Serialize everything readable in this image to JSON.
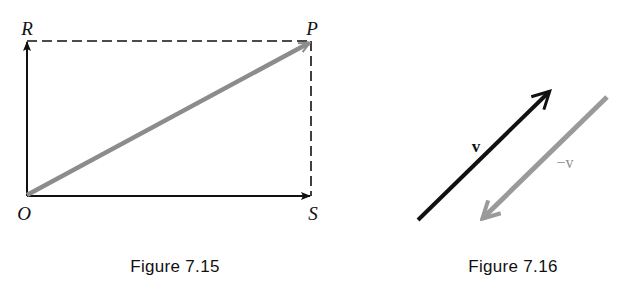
{
  "figures": [
    {
      "caption": "Figure 7.15",
      "points": {
        "O": {
          "label": "O",
          "x": 27,
          "y": 196
        },
        "R": {
          "label": "R",
          "x": 27,
          "y": 41
        },
        "P": {
          "label": "P",
          "x": 311,
          "y": 41
        },
        "S": {
          "label": "S",
          "x": 311,
          "y": 196
        }
      },
      "elements": [
        {
          "type": "arrow",
          "from": "O",
          "to": "R",
          "style": "solid",
          "color": "#111111"
        },
        {
          "type": "arrow",
          "from": "O",
          "to": "S",
          "style": "solid",
          "color": "#111111"
        },
        {
          "type": "arrow",
          "from": "O",
          "to": "P",
          "style": "solid-thick",
          "color": "#8c8c8c"
        },
        {
          "type": "line",
          "from": "R",
          "to": "P",
          "style": "dashed",
          "color": "#111111"
        },
        {
          "type": "line",
          "from": "S",
          "to": "P",
          "style": "dashed",
          "color": "#111111"
        }
      ]
    },
    {
      "caption": "Figure 7.16",
      "vectors": [
        {
          "label": "v",
          "from": [
            418,
            220
          ],
          "to": [
            551,
            90
          ],
          "color": "#111111"
        },
        {
          "label": "−v",
          "from": [
            607,
            97
          ],
          "to": [
            481,
            220
          ],
          "color": "#9a9a9a"
        }
      ]
    }
  ],
  "colors": {
    "ink": "#111111",
    "gray_vector": "#8c8c8c",
    "neg_vector": "#9a9a9a",
    "background": "#ffffff"
  }
}
